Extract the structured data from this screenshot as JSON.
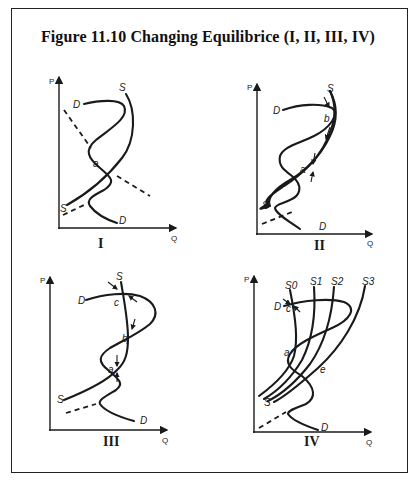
{
  "figure": {
    "title": "Figure 11.10 Changing Equilibrice (I, II, III, IV)",
    "axes": {
      "y_label": "P",
      "x_label": "Q"
    },
    "panels": [
      {
        "id": "I",
        "label": "I",
        "curve_labels": {
          "supply_top": "S",
          "supply_bottom": "S",
          "demand_top": "D",
          "demand_bottom": "D"
        },
        "points": {
          "a": "a"
        }
      },
      {
        "id": "II",
        "label": "II",
        "curve_labels": {
          "supply_top": "S",
          "supply_bottom": "S",
          "demand_top": "D",
          "demand_bottom": "D"
        },
        "points": {
          "a": "a",
          "b": "b"
        }
      },
      {
        "id": "III",
        "label": "III",
        "curve_labels": {
          "supply_top": "S",
          "supply_bottom": "S",
          "demand_top": "D",
          "demand_bottom": "D"
        },
        "points": {
          "a": "a",
          "b": "b",
          "c": "c"
        }
      },
      {
        "id": "IV",
        "label": "IV",
        "curve_labels": {
          "s0": "S0",
          "s1": "S1",
          "s2": "S2",
          "s3": "S3",
          "supply_bottom": "S",
          "demand_top": "D",
          "demand_bottom": "D"
        },
        "points": {
          "a": "a",
          "c": "c",
          "e": "e"
        }
      }
    ]
  }
}
